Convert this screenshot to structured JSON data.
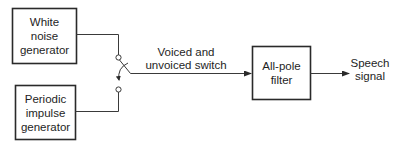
{
  "blocks": {
    "white_noise": {
      "lines": [
        "White",
        "noise",
        "generator"
      ]
    },
    "periodic_impulse": {
      "lines": [
        "Periodic",
        "impulse",
        "generator"
      ]
    },
    "all_pole_filter": {
      "lines": [
        "All-pole",
        "filter"
      ]
    }
  },
  "switch": {
    "lines": [
      "Voiced and",
      "unvoiced switch"
    ]
  },
  "output": {
    "lines": [
      "Speech",
      "signal"
    ]
  },
  "colors": {
    "stroke": "#2a2a2a",
    "text": "#1e1e1e",
    "background": "#ffffff"
  }
}
